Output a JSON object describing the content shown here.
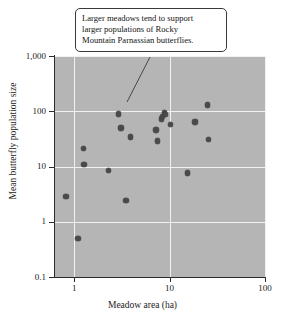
{
  "chart_data": {
    "type": "scatter",
    "title": "",
    "xlabel": "Meadow area (ha)",
    "ylabel": "Mean butterfly population size",
    "xscale": "log",
    "yscale": "log",
    "xlim": [
      0.63,
      100
    ],
    "ylim": [
      0.1,
      1000
    ],
    "grid": true,
    "legend": null,
    "xticks": [
      "1",
      "10",
      "100"
    ],
    "xtick_values": [
      1,
      10,
      100
    ],
    "yticks": [
      "1,000",
      "100",
      "10",
      "1",
      "0.1"
    ],
    "ytick_values": [
      1000,
      100,
      10,
      1,
      0.1
    ],
    "marker_color": "#4a4a4a",
    "panel_color": "#b5b5b5",
    "grid_color": "#f2f2f2",
    "points": [
      {
        "x": 0.82,
        "y": 2.9
      },
      {
        "x": 1.1,
        "y": 0.5
      },
      {
        "x": 1.25,
        "y": 21
      },
      {
        "x": 1.27,
        "y": 11
      },
      {
        "x": 2.3,
        "y": 8.5
      },
      {
        "x": 2.9,
        "y": 89
      },
      {
        "x": 3.1,
        "y": 50
      },
      {
        "x": 3.5,
        "y": 2.4
      },
      {
        "x": 3.9,
        "y": 34
      },
      {
        "x": 7.2,
        "y": 46
      },
      {
        "x": 7.5,
        "y": 29
      },
      {
        "x": 8.2,
        "y": 73
      },
      {
        "x": 8.4,
        "y": 80
      },
      {
        "x": 8.8,
        "y": 95
      },
      {
        "x": 9.0,
        "y": 88
      },
      {
        "x": 10.2,
        "y": 57
      },
      {
        "x": 15.5,
        "y": 7.6
      },
      {
        "x": 18.5,
        "y": 64
      },
      {
        "x": 25.0,
        "y": 130
      },
      {
        "x": 25.5,
        "y": 31
      }
    ],
    "annotations": [
      {
        "name": "trend-callout",
        "lines": [
          "Larger meadows tend to support",
          "larger populations of Rocky",
          "Mountain Parnassian butterflies."
        ],
        "text": "Larger meadows tend to support larger populations of Rocky Mountain Parnassian butterflies.",
        "leader_from": [
          150,
          57
        ],
        "leader_to": [
          127,
          102
        ]
      }
    ]
  },
  "axes": {
    "y": {
      "label": "Mean butterfly population size",
      "ticks": [
        {
          "label": "1,000"
        },
        {
          "label": "100"
        },
        {
          "label": "10"
        },
        {
          "label": "1"
        },
        {
          "label": "0.1"
        }
      ]
    },
    "x": {
      "label": "Meadow area (ha)",
      "ticks": [
        {
          "label": "1"
        },
        {
          "label": "10"
        },
        {
          "label": "100"
        }
      ]
    }
  },
  "callout": {
    "line1": "Larger meadows tend to support",
    "line2": "larger populations of Rocky",
    "line3": "Mountain Parnassian butterflies."
  }
}
